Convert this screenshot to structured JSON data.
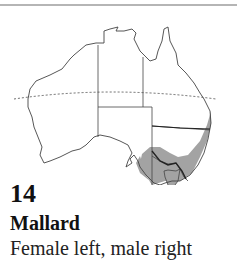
{
  "entry": {
    "number": "14",
    "species": "Mallard",
    "caption": "Female left, male right"
  },
  "map": {
    "region": "Australia",
    "features": [
      "state-borders",
      "tropic-of-capricorn-dashed-line",
      "distribution-shading"
    ],
    "distribution_color": "#a3a3a3",
    "outline_color": "#444444"
  }
}
